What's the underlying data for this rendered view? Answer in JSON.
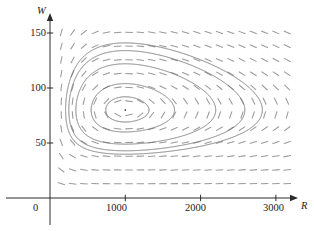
{
  "figure": {
    "kind": "direction-field-phase-portrait",
    "axes": {
      "x": {
        "label": "R",
        "origin_label": "0",
        "ticks": [
          {
            "value": 1000,
            "label": "1000"
          },
          {
            "value": 2000,
            "label": "2000"
          },
          {
            "value": 3000,
            "label": "3000"
          }
        ],
        "range": [
          0,
          3300
        ],
        "arrow": true
      },
      "y": {
        "label": "W",
        "ticks": [
          {
            "value": 50,
            "label": "50"
          },
          {
            "value": 100,
            "label": "100"
          },
          {
            "value": 150,
            "label": "150"
          }
        ],
        "range": [
          0,
          170
        ],
        "arrow": true
      }
    },
    "colors": {
      "axis": "#2b2b2b",
      "field": "#9a9a9a",
      "orbit": "#6a6a6a",
      "equilibrium": "#555555",
      "background": "#ffffff"
    }
  },
  "chart_data": {
    "type": "line",
    "title": "",
    "xlabel": "R",
    "ylabel": "W",
    "xlim": [
      0,
      3300
    ],
    "ylim": [
      0,
      170
    ],
    "grid": false,
    "legend": null,
    "model": {
      "name": "Lotka-Volterra predator-prey",
      "equations": [
        "dR/dt = a*R - b*R*W",
        "dW/dt = -c*W + d*R*W"
      ],
      "a": 0.08,
      "b": 0.001,
      "c": 0.02,
      "d": 2e-05
    },
    "equilibrium": {
      "R": 1000,
      "W": 80
    },
    "direction_field": {
      "x_start": 150,
      "x_step": 150,
      "x_count": 21,
      "y_start": 13,
      "y_step": 12.5,
      "y_count": 12,
      "segment_length_px": 7.5
    },
    "orbits": [
      {
        "name": "innermost",
        "start": {
          "R": 1000,
          "W": 92
        }
      },
      {
        "name": "inner",
        "start": {
          "R": 1000,
          "W": 104
        }
      },
      {
        "name": "middle",
        "start": {
          "R": 1000,
          "W": 122
        }
      },
      {
        "name": "outer",
        "start": {
          "R": 1000,
          "W": 134
        }
      },
      {
        "name": "outermost",
        "start": {
          "R": 1000,
          "W": 141
        }
      }
    ]
  }
}
